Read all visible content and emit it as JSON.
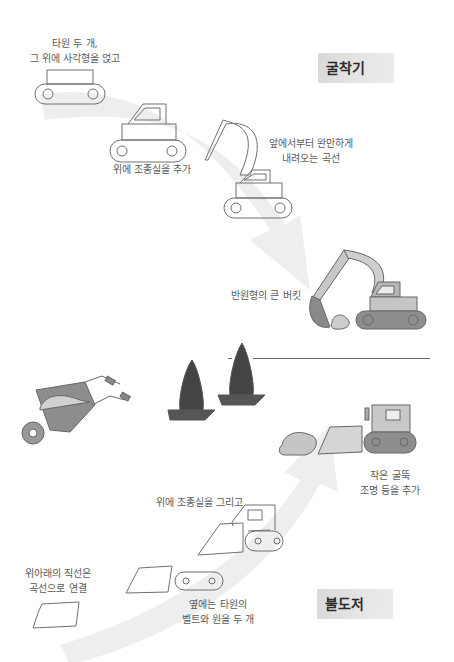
{
  "excavator": {
    "title": "굴착기",
    "step1": {
      "line1": "타원 두 개,",
      "line2": "그 위에 사각형을 얹고"
    },
    "step2": {
      "line1": "위에 조종실을 추가"
    },
    "step3": {
      "line1": "앞에서부터 완만하게",
      "line2": "내려오는 곡선"
    },
    "step4": {
      "line1": "반원형의 큰 버킷"
    }
  },
  "bulldozer": {
    "title": "불도저",
    "step1": {
      "line1": "위아래의 직선은",
      "line2": "곡선으로 연결"
    },
    "step2": {
      "line1": "옆에는 타원의",
      "line2": "벨트와 원을 두 개"
    },
    "step3": {
      "line1": "위에 조종실을 그리고"
    },
    "step4": {
      "line1": "작은 굴뚝",
      "line2": "조명 등을 추가"
    }
  },
  "colors": {
    "arrow": "#ececec",
    "line": "#707070",
    "fill_light": "#c8c8c8",
    "fill_mid": "#9a9a9a",
    "fill_dark": "#555555",
    "tag_bg": "#dddddd"
  }
}
